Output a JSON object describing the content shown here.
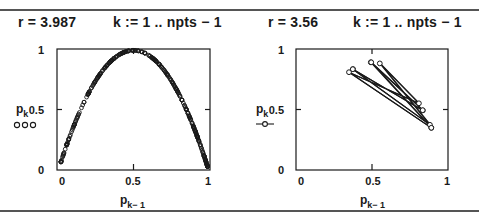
{
  "panels": [
    {
      "header": {
        "r_def": "r = 3.987",
        "range_def": "k := 1 .. npts − 1"
      },
      "y_label": "p",
      "y_label_sub": "k",
      "x_label": "p",
      "x_label_sub": "k− 1",
      "legend_marker": "circles",
      "legend_text": "o o o",
      "x_ticks": [
        "0",
        "0.5",
        "1"
      ],
      "y_ticks": [
        "0",
        "0.5",
        "1"
      ]
    },
    {
      "header": {
        "r_def": "r = 3.56",
        "range_def": "k := 1 .. npts − 1"
      },
      "y_label": "p",
      "y_label_sub": "k",
      "x_label": "p",
      "x_label_sub": "k− 1",
      "legend_marker": "line-with-circle",
      "x_ticks": [
        "0",
        "0.5",
        "1"
      ],
      "y_ticks": [
        "0",
        "0.5",
        "1"
      ]
    }
  ],
  "chart_data": [
    {
      "type": "scatter",
      "title": "r = 3.987",
      "xlabel": "p_{k-1}",
      "ylabel": "p_k",
      "xlim": [
        0,
        1
      ],
      "ylim": [
        0,
        1
      ],
      "x_ticks": [
        0,
        0.5,
        1
      ],
      "y_ticks": [
        0,
        0.5,
        1
      ],
      "marker": "open circle",
      "grid": false,
      "description": "Logistic map return plot p_k = r*p_{k-1}*(1-p_{k-1}) with r = 3.987 (chaotic); points densely fill the parabola",
      "r": 3.987,
      "sample_points": [
        [
          0.02,
          0.078
        ],
        [
          0.05,
          0.189
        ],
        [
          0.1,
          0.359
        ],
        [
          0.15,
          0.508
        ],
        [
          0.2,
          0.638
        ],
        [
          0.25,
          0.748
        ],
        [
          0.3,
          0.837
        ],
        [
          0.35,
          0.907
        ],
        [
          0.4,
          0.957
        ],
        [
          0.45,
          0.987
        ],
        [
          0.5,
          0.997
        ],
        [
          0.55,
          0.987
        ],
        [
          0.6,
          0.957
        ],
        [
          0.65,
          0.907
        ],
        [
          0.7,
          0.837
        ],
        [
          0.75,
          0.748
        ],
        [
          0.8,
          0.638
        ],
        [
          0.85,
          0.508
        ],
        [
          0.9,
          0.359
        ],
        [
          0.95,
          0.189
        ],
        [
          0.98,
          0.078
        ]
      ]
    },
    {
      "type": "line",
      "title": "r = 3.56",
      "xlabel": "p_{k-1}",
      "ylabel": "p_k",
      "xlim": [
        0,
        1
      ],
      "ylim": [
        0,
        1
      ],
      "x_ticks": [
        0,
        0.5,
        1
      ],
      "y_ticks": [
        0,
        0.5,
        1
      ],
      "marker": "open circle with connecting line",
      "grid": false,
      "description": "Logistic map return plot with r = 3.56 (period-8 cycle); consecutive points connected by lines",
      "r": 3.56,
      "points": [
        [
          0.3748,
          0.8342
        ],
        [
          0.8342,
          0.4924
        ],
        [
          0.4924,
          0.8899
        ],
        [
          0.8899,
          0.3488
        ],
        [
          0.3488,
          0.8086
        ],
        [
          0.8086,
          0.551
        ],
        [
          0.551,
          0.8808
        ],
        [
          0.8808,
          0.3738
        ],
        [
          0.3738,
          0.8333
        ],
        [
          0.8333,
          0.4945
        ],
        [
          0.4945,
          0.8899
        ],
        [
          0.8899,
          0.3488
        ]
      ]
    }
  ]
}
